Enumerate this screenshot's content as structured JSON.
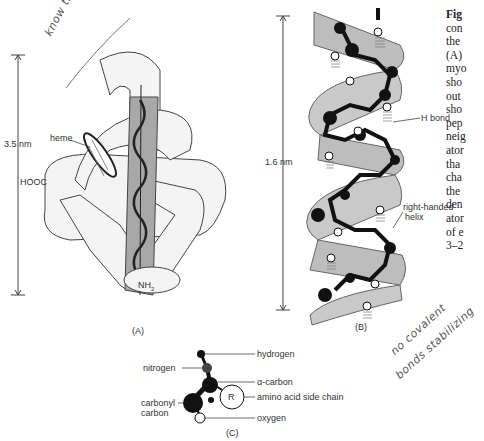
{
  "figure": {
    "panel_a": {
      "label": "(A)",
      "dimension": "3.5 nm",
      "labels": {
        "heme": "heme",
        "c_term": "HOOC",
        "n_term": "NH",
        "n_term_sub": "2"
      }
    },
    "panel_b": {
      "label": "(B)",
      "dimension": "1.6 nm",
      "labels": {
        "h_bond": "H bond",
        "helix_line1": "right-handed",
        "helix_line2": "helix"
      }
    },
    "panel_c": {
      "label": "(C)",
      "labels": {
        "hydrogen": "hydrogen",
        "nitrogen": "nitrogen",
        "alpha_carbon": "α-carbon",
        "r_group": "R",
        "side_chain": "amino acid side chain",
        "carbonyl_line1": "carbonyl",
        "carbonyl_line2": "carbon",
        "oxygen": "oxygen"
      }
    },
    "caption_fragments": [
      "Fig",
      "con",
      "the",
      "(A) ",
      "myo",
      "sho",
      "out",
      "sho",
      "pep",
      "neig",
      "ator",
      "tha",
      "cha",
      "the",
      "den",
      "ator",
      "of e",
      "3–2"
    ]
  },
  "annotations": {
    "top_left": "know this",
    "bottom_right_line1": "no covalent",
    "bottom_right_line2": "bonds stabilizing"
  },
  "colors": {
    "helix_ribbon": "#b9b9b9",
    "atom_dark": "#111111",
    "line": "#333333"
  }
}
